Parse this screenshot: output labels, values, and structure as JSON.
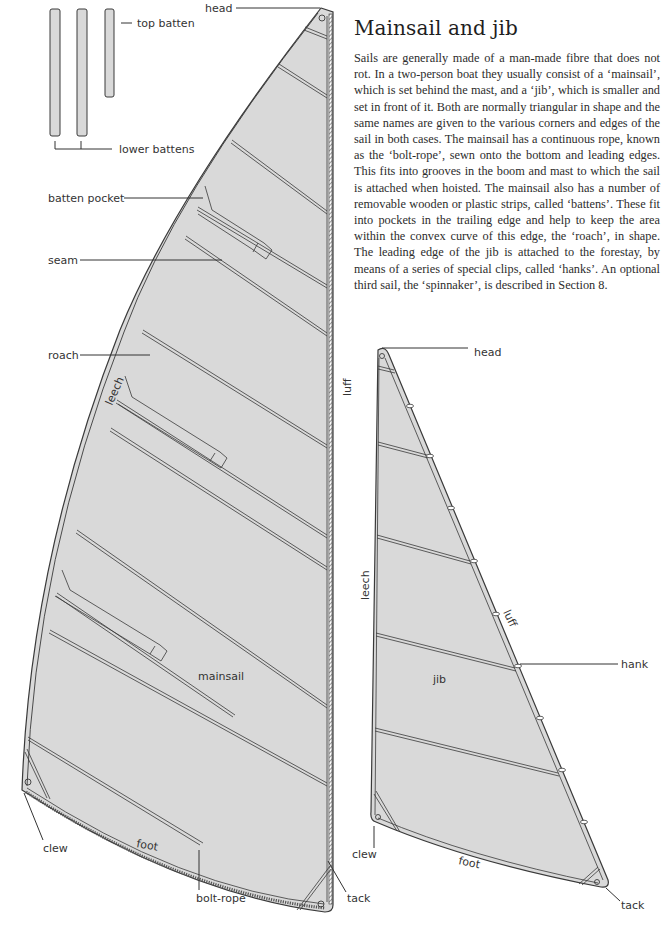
{
  "article": {
    "title": "Mainsail and jib",
    "body": "Sails are generally made of a man-made fibre that does not rot. In a two-person boat they usually con­sist of a ‘mainsail’, which is set behind the mast, and a ‘jib’, which is smaller and set in front of it. Both are normally triangular in shape and the same names are given to the various corners and edges of the sail in both cases. The mainsail has a continuous rope, known as the ‘bolt-rope’, sewn onto the bottom and leading edges. This fits into grooves in the boom and mast to which the sail is attached when hoisted. The mainsail also has a number of removable wooden or plastic strips, called ‘battens’. These fit into pockets in the trailing edge and help to keep the area within the convex curve of this edge, the ‘roach’, in shape. The leading edge of the jib is attached to the forestay, by means of a series of special clips, called ‘hanks’. An optional third sail, the ‘spinnaker’, is described in Section 8."
  },
  "battens": {
    "top_label": "top batten",
    "lower_label": "lower battens"
  },
  "mainsail": {
    "name": "mainsail",
    "labels": {
      "head": "head",
      "batten_pocket": "batten pocket",
      "seam": "seam",
      "roach": "roach",
      "leech": "leech",
      "luff": "luff",
      "clew": "clew",
      "foot": "foot",
      "bolt_rope": "bolt-rope",
      "tack": "tack"
    }
  },
  "jib": {
    "name": "jib",
    "labels": {
      "head": "head",
      "leech": "leech",
      "luff": "luff",
      "hank": "hank",
      "clew": "clew",
      "foot": "foot",
      "tack": "tack"
    }
  },
  "colors": {
    "sail_fill": "#d9d9d9",
    "line": "#3a3a3a",
    "paper": "#ffffff"
  }
}
